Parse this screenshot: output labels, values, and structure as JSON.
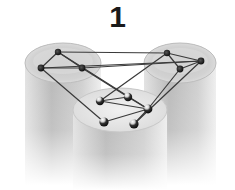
{
  "figure": {
    "label": "1",
    "colors": {
      "background": "#ffffff",
      "cylinder_body": "#bdbdbd",
      "cylinder_top": "#d9d9d9",
      "edge": "#3a3a3a",
      "node": "#1e1e1e",
      "node_highlight": "#f0f0f0"
    },
    "cylinders": [
      {
        "id": "left",
        "cx": 63,
        "top": 63,
        "rx": 38,
        "ry": 20,
        "bottom": 185
      },
      {
        "id": "right",
        "cx": 180,
        "top": 63,
        "rx": 36,
        "ry": 20,
        "bottom": 185
      },
      {
        "id": "center",
        "cx": 120,
        "top": 110,
        "rx": 47,
        "ry": 22,
        "bottom": 190
      }
    ],
    "nodes": [
      {
        "id": "L1",
        "x": 58,
        "y": 52,
        "group": "left"
      },
      {
        "id": "L2",
        "x": 41,
        "y": 68,
        "group": "left"
      },
      {
        "id": "L3",
        "x": 82,
        "y": 68,
        "group": "left"
      },
      {
        "id": "R1",
        "x": 167,
        "y": 53,
        "group": "right"
      },
      {
        "id": "R2",
        "x": 201,
        "y": 61,
        "group": "right"
      },
      {
        "id": "R3",
        "x": 180,
        "y": 69,
        "group": "right"
      },
      {
        "id": "C1",
        "x": 100,
        "y": 101,
        "group": "center"
      },
      {
        "id": "C2",
        "x": 128,
        "y": 97,
        "group": "center"
      },
      {
        "id": "C3",
        "x": 148,
        "y": 109,
        "group": "center"
      },
      {
        "id": "C4",
        "x": 104,
        "y": 122,
        "group": "center"
      },
      {
        "id": "C5",
        "x": 134,
        "y": 124,
        "group": "center"
      }
    ],
    "edges": [
      [
        "L1",
        "L2"
      ],
      [
        "L1",
        "L3"
      ],
      [
        "L2",
        "L3"
      ],
      [
        "L1",
        "R1"
      ],
      [
        "L2",
        "R2"
      ],
      [
        "L3",
        "R2"
      ],
      [
        "R1",
        "R2"
      ],
      [
        "R1",
        "R3"
      ],
      [
        "R2",
        "R3"
      ],
      [
        "L1",
        "C3"
      ],
      [
        "L2",
        "C4"
      ],
      [
        "L3",
        "C2"
      ],
      [
        "R1",
        "C1"
      ],
      [
        "R2",
        "C5"
      ],
      [
        "R3",
        "C3"
      ],
      [
        "C1",
        "C2"
      ],
      [
        "C1",
        "C3"
      ],
      [
        "C2",
        "C3"
      ],
      [
        "C3",
        "C4"
      ],
      [
        "C3",
        "C5"
      ]
    ]
  }
}
